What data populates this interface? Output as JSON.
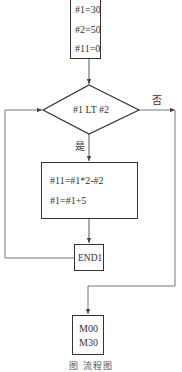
{
  "diagram": {
    "type": "flowchart",
    "init_box": {
      "lines": [
        "#1=30",
        "#2=50",
        "#11=0"
      ]
    },
    "decision": {
      "condition": "#1 LT #2",
      "yes_label": "是",
      "no_label": "否"
    },
    "process_box": {
      "lines": [
        "#11=#1*2-#2",
        "#1=#1+5"
      ]
    },
    "loop_end": {
      "label": "END1"
    },
    "end_box": {
      "lines": [
        "M00",
        "M30"
      ]
    },
    "caption": "图     流程图"
  },
  "colors": {
    "line": "#555555",
    "box_border": "#333333",
    "text": "#333333"
  }
}
